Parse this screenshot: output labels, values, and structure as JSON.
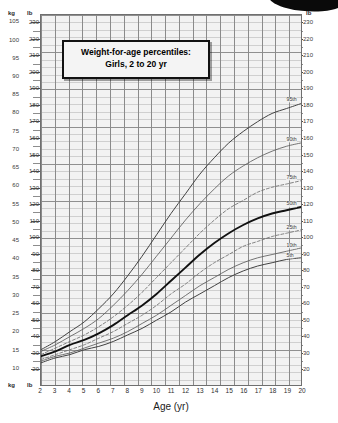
{
  "title": {
    "line1": "Weight-for-age percentiles:",
    "line2": "Girls, 2 to 20 yr"
  },
  "units": {
    "left_kg": "kg",
    "left_lb": "lb",
    "right_lb": "lb",
    "right_kg": "kg",
    "bottom_kg": "kg",
    "bottom_lb": "lb"
  },
  "x_axis": {
    "label": "Age (yr)",
    "ticks": [
      "2",
      "3",
      "4",
      "5",
      "6",
      "7",
      "8",
      "9",
      "10",
      "11",
      "12",
      "13",
      "14",
      "15",
      "16",
      "17",
      "18",
      "19",
      "20"
    ]
  },
  "y_axis_kg": {
    "ticks": [
      "105",
      "100",
      "95",
      "90",
      "85",
      "80",
      "75",
      "70",
      "65",
      "60",
      "55",
      "50",
      "45",
      "40",
      "35",
      "30",
      "25",
      "20",
      "15",
      "10"
    ]
  },
  "y_axis_lb": {
    "ticks": [
      "230",
      "220",
      "210",
      "200",
      "190",
      "180",
      "170",
      "160",
      "150",
      "140",
      "130",
      "120",
      "110",
      "100",
      "90",
      "80",
      "70",
      "60",
      "50",
      "40",
      "30",
      "20"
    ]
  },
  "percentile_labels": [
    "95th",
    "90th",
    "75th",
    "50th",
    "25th",
    "10th",
    "5th"
  ],
  "colors": {
    "grid_minor": "#cfcfcf",
    "grid_major": "#8a8a8a",
    "plot_bg": "#f2f2f2",
    "curve": "#4a4a4a",
    "curve_median": "#111111",
    "frame": "#6f6f6f"
  },
  "chart_data": {
    "type": "line",
    "title": "Weight-for-age percentiles: Girls, 2 to 20 yr",
    "xlabel": "Age (yr)",
    "ylabel": "Weight (lb / kg)",
    "xlim": [
      2,
      20
    ],
    "ylim_lb": [
      10,
      235
    ],
    "ylim_kg": [
      5,
      107
    ],
    "grid": true,
    "legend": "right-edge curve labels",
    "x": [
      2,
      3,
      4,
      5,
      6,
      7,
      8,
      9,
      10,
      11,
      12,
      13,
      14,
      15,
      16,
      17,
      18,
      19,
      20
    ],
    "series": [
      {
        "name": "95th",
        "unit": "lb",
        "values": [
          31,
          36,
          42,
          48,
          56,
          65,
          76,
          88,
          101,
          114,
          126,
          138,
          148,
          157,
          164,
          170,
          175,
          178,
          181
        ]
      },
      {
        "name": "90th",
        "unit": "lb",
        "values": [
          30,
          34,
          39,
          44,
          50,
          58,
          67,
          77,
          88,
          99,
          110,
          120,
          129,
          137,
          143,
          148,
          152,
          155,
          157
        ]
      },
      {
        "name": "75th",
        "unit": "lb",
        "values": [
          28,
          32,
          36,
          40,
          45,
          51,
          58,
          66,
          75,
          84,
          93,
          102,
          110,
          117,
          122,
          127,
          130,
          132,
          134
        ]
      },
      {
        "name": "50th",
        "unit": "lb",
        "values": [
          27,
          30,
          34,
          37,
          41,
          46,
          52,
          58,
          65,
          73,
          81,
          89,
          96,
          102,
          107,
          111,
          114,
          116,
          118
        ]
      },
      {
        "name": "25th",
        "unit": "lb",
        "values": [
          25,
          28,
          31,
          34,
          38,
          42,
          47,
          52,
          58,
          65,
          71,
          78,
          84,
          89,
          94,
          97,
          100,
          102,
          104
        ]
      },
      {
        "name": "10th",
        "unit": "lb",
        "values": [
          24,
          27,
          29,
          32,
          35,
          38,
          42,
          47,
          52,
          58,
          64,
          70,
          75,
          80,
          84,
          87,
          89,
          91,
          93
        ]
      },
      {
        "name": "5th",
        "unit": "lb",
        "values": [
          23,
          26,
          28,
          31,
          33,
          36,
          40,
          44,
          49,
          54,
          60,
          65,
          70,
          75,
          79,
          82,
          84,
          86,
          87
        ]
      }
    ]
  }
}
